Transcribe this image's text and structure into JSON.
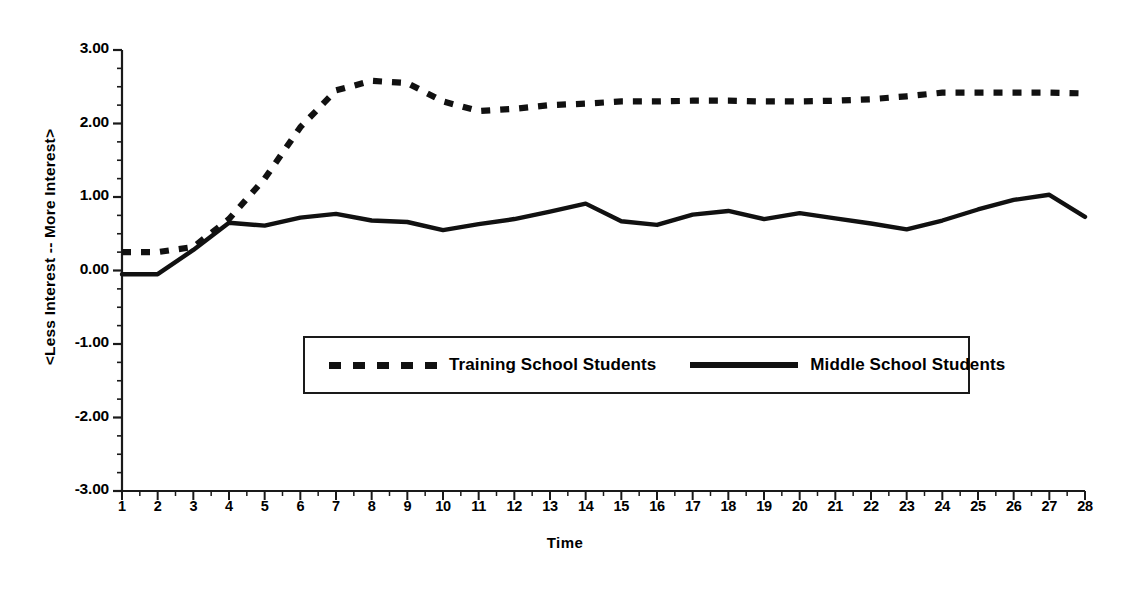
{
  "chart_data": {
    "type": "line",
    "title": "",
    "xlabel": "Time",
    "ylabel": "<Less Interest  --  More Interest>",
    "xlim": [
      1,
      28
    ],
    "ylim": [
      -3.0,
      3.0
    ],
    "grid": false,
    "legend_position": "center",
    "x": [
      1,
      2,
      3,
      4,
      5,
      6,
      7,
      8,
      9,
      10,
      11,
      12,
      13,
      14,
      15,
      16,
      17,
      18,
      19,
      20,
      21,
      22,
      23,
      24,
      25,
      26,
      27,
      28
    ],
    "x_tick_labels": [
      "1",
      "2",
      "3",
      "4",
      "5",
      "6",
      "7",
      "8",
      "9",
      "10",
      "11",
      "12",
      "13",
      "14",
      "15",
      "16",
      "17",
      "18",
      "19",
      "20",
      "21",
      "22",
      "23",
      "24",
      "25",
      "26",
      "27",
      "28"
    ],
    "y_tick_labels": [
      "3.00",
      "2.00",
      "1.00",
      "0.00",
      "-1.00",
      "-2.00",
      "-3.00"
    ],
    "y_ticks": [
      3.0,
      2.0,
      1.0,
      0.0,
      -1.0,
      -2.0,
      -3.0
    ],
    "y_minor_tick_step": 0.25,
    "series": [
      {
        "name": "Training School Students",
        "style": "dashed",
        "color": "#111111",
        "values": [
          0.25,
          0.25,
          0.32,
          0.7,
          1.25,
          1.95,
          2.45,
          2.58,
          2.55,
          2.3,
          2.17,
          2.2,
          2.25,
          2.27,
          2.3,
          2.3,
          2.31,
          2.31,
          2.3,
          2.3,
          2.31,
          2.33,
          2.37,
          2.42,
          2.42,
          2.42,
          2.42,
          2.41
        ]
      },
      {
        "name": "Middle School Students",
        "style": "solid",
        "color": "#111111",
        "values": [
          -0.05,
          -0.05,
          0.28,
          0.65,
          0.61,
          0.72,
          0.77,
          0.68,
          0.66,
          0.55,
          0.63,
          0.7,
          0.8,
          0.91,
          0.67,
          0.62,
          0.76,
          0.81,
          0.7,
          0.78,
          0.71,
          0.64,
          0.56,
          0.68,
          0.83,
          0.96,
          1.03,
          0.73
        ]
      }
    ]
  },
  "axes": {
    "y_title": "<Less Interest  --  More Interest>",
    "x_title": "Time"
  },
  "legend": {
    "entries": [
      {
        "label": "Training School Students",
        "style": "dashed"
      },
      {
        "label": "Middle School Students",
        "style": "solid"
      }
    ]
  }
}
